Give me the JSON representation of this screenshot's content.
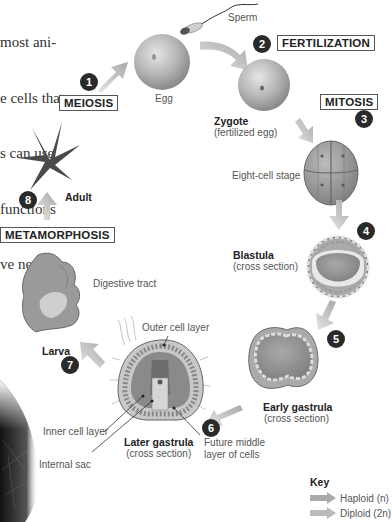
{
  "body_text": {
    "lines": [
      "most ani-",
      "e cells that",
      "s can use",
      "functions",
      "ve net-"
    ]
  },
  "stages": {
    "egg": "Egg",
    "sperm": "Sperm",
    "zygote_title": "Zygote",
    "zygote_sub": "(fertilized egg)",
    "eight_cell": "Eight-cell stage",
    "blastula_title": "Blastula",
    "blastula_sub": "(cross section)",
    "early_gastrula_title": "Early gastrula",
    "early_gastrula_sub": "(cross section)",
    "later_gastrula_title": "Later gastrula",
    "later_gastrula_sub": "(cross section)",
    "larva": "Larva",
    "adult": "Adult"
  },
  "callouts": {
    "outer_cell_layer": "Outer cell layer",
    "inner_cell_layer": "Inner cell layer",
    "internal_sac": "Internal sac",
    "future_middle_1": "Future middle",
    "future_middle_2": "layer of cells",
    "digestive_tract": "Digestive tract"
  },
  "processes": {
    "meiosis": "MEIOSIS",
    "fertilization": "FERTILIZATION",
    "mitosis": "MITOSIS",
    "metamorphosis": "METAMORPHOSIS"
  },
  "steps": [
    "1",
    "2",
    "3",
    "4",
    "5",
    "6",
    "7",
    "8"
  ],
  "key": {
    "title": "Key",
    "haploid": "Haploid (n)",
    "diploid": "Diploid (2n)",
    "haploid_color": "#b0b0b0",
    "diploid_color": "#a8a8a8"
  }
}
